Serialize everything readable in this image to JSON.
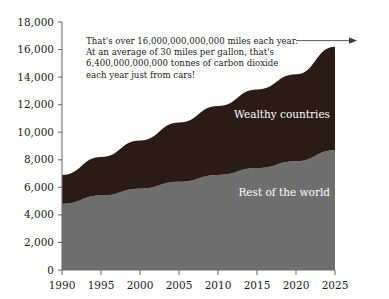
{
  "chart_data": {
    "type": "area",
    "stacked": true,
    "title": "",
    "subtitle": "",
    "xlabel": "",
    "ylabel": "",
    "xlim": [
      1990,
      2025
    ],
    "ylim": [
      0,
      18000
    ],
    "grid": false,
    "legend_position": "inline-on-bands",
    "x": [
      1990,
      1995,
      2000,
      2005,
      2010,
      2015,
      2020,
      2025
    ],
    "xtick_labels": [
      "1990",
      "1995",
      "2000",
      "2005",
      "2010",
      "2015",
      "2020",
      "2025"
    ],
    "ytick_values": [
      0,
      2000,
      4000,
      6000,
      8000,
      10000,
      12000,
      14000,
      16000,
      18000
    ],
    "ytick_labels": [
      "0",
      "2,000",
      "4,000",
      "6,000",
      "8,000",
      "10,000",
      "12,000",
      "14,000",
      "16,000",
      "18,000"
    ],
    "series": [
      {
        "name": "Rest of the world",
        "color": "#6e6e6e",
        "label_color": "#ffffff",
        "values": [
          4800,
          5400,
          5900,
          6400,
          6900,
          7400,
          7900,
          8700
        ]
      },
      {
        "name": "Wealthy countries",
        "color": "#2b1b15",
        "label_color": "#ffffff",
        "values": [
          2100,
          2800,
          3500,
          4300,
          5000,
          5700,
          6300,
          7500
        ]
      }
    ],
    "totals": [
      6900,
      8200,
      9400,
      10700,
      11900,
      13100,
      14200,
      16200
    ],
    "annotations": [
      {
        "name": "miles-per-year-note",
        "lines": [
          "That's over 16,000,000,000,000 miles each year.",
          "At an average of 30 miles per gallon, that's",
          "6,400,000,000,000 tonnes of carbon dioxide",
          "each year just from cars!"
        ],
        "arrow": true,
        "arrow_points_to": "total-at-2025"
      }
    ]
  },
  "series_labels": {
    "wealthy": "Wealthy countries",
    "rest": "Rest of the world"
  }
}
